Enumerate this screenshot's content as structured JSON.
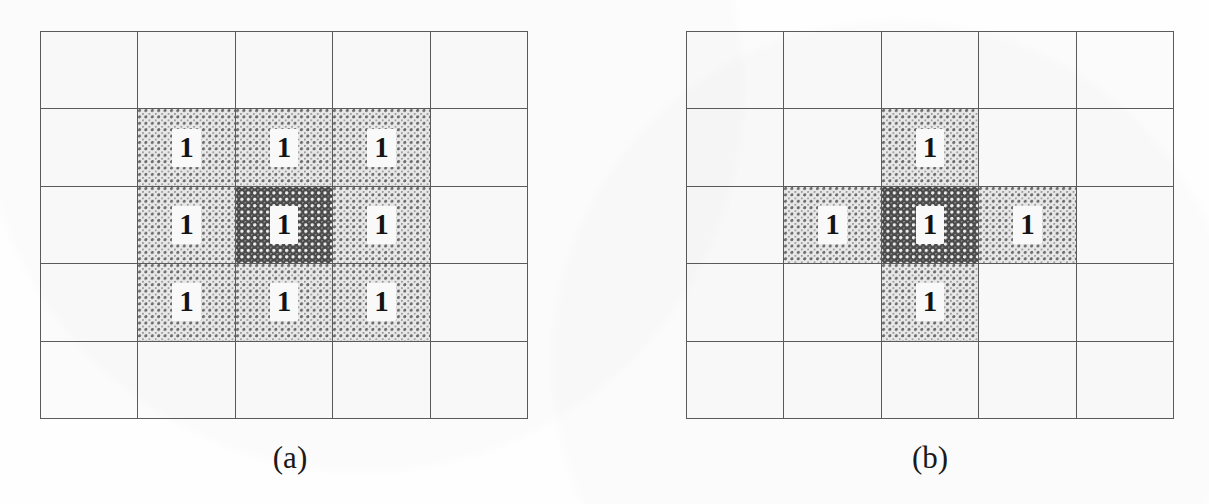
{
  "figure": {
    "kind": "pixel-neighborhood-diagram",
    "background_color": "#fefefe",
    "grid_line_color": "#5b5b5b",
    "cell_color": "#fbfbfb",
    "light_shade_color": "#ebebeb",
    "dark_shade_color": "#4b4b4b",
    "rows": 5,
    "columns": 5,
    "cell_value": "1"
  },
  "panels": [
    {
      "id": "panel-a",
      "caption": "(a)",
      "name": "8-neighborhood-grid",
      "left": 40,
      "top": 31,
      "width": 488,
      "height": 388,
      "caption_center_x": 290,
      "caption_top": 440,
      "cells": [
        [
          {
            "shade": "none",
            "value": ""
          },
          {
            "shade": "none",
            "value": ""
          },
          {
            "shade": "none",
            "value": ""
          },
          {
            "shade": "none",
            "value": ""
          },
          {
            "shade": "none",
            "value": ""
          }
        ],
        [
          {
            "shade": "none",
            "value": ""
          },
          {
            "shade": "light",
            "value": "1"
          },
          {
            "shade": "light",
            "value": "1"
          },
          {
            "shade": "light",
            "value": "1"
          },
          {
            "shade": "none",
            "value": ""
          }
        ],
        [
          {
            "shade": "none",
            "value": ""
          },
          {
            "shade": "light",
            "value": "1"
          },
          {
            "shade": "dark",
            "value": "1"
          },
          {
            "shade": "light",
            "value": "1"
          },
          {
            "shade": "none",
            "value": ""
          }
        ],
        [
          {
            "shade": "none",
            "value": ""
          },
          {
            "shade": "light",
            "value": "1"
          },
          {
            "shade": "light",
            "value": "1"
          },
          {
            "shade": "light",
            "value": "1"
          },
          {
            "shade": "none",
            "value": ""
          }
        ],
        [
          {
            "shade": "none",
            "value": ""
          },
          {
            "shade": "none",
            "value": ""
          },
          {
            "shade": "none",
            "value": ""
          },
          {
            "shade": "none",
            "value": ""
          },
          {
            "shade": "none",
            "value": ""
          }
        ]
      ]
    },
    {
      "id": "panel-b",
      "caption": "(b)",
      "name": "4-neighborhood-grid",
      "left": 686,
      "top": 31,
      "width": 488,
      "height": 388,
      "caption_center_x": 930,
      "caption_top": 440,
      "cells": [
        [
          {
            "shade": "none",
            "value": ""
          },
          {
            "shade": "none",
            "value": ""
          },
          {
            "shade": "none",
            "value": ""
          },
          {
            "shade": "none",
            "value": ""
          },
          {
            "shade": "none",
            "value": ""
          }
        ],
        [
          {
            "shade": "none",
            "value": ""
          },
          {
            "shade": "none",
            "value": ""
          },
          {
            "shade": "light",
            "value": "1"
          },
          {
            "shade": "none",
            "value": ""
          },
          {
            "shade": "none",
            "value": ""
          }
        ],
        [
          {
            "shade": "none",
            "value": ""
          },
          {
            "shade": "light",
            "value": "1"
          },
          {
            "shade": "dark",
            "value": "1"
          },
          {
            "shade": "light",
            "value": "1"
          },
          {
            "shade": "none",
            "value": ""
          }
        ],
        [
          {
            "shade": "none",
            "value": ""
          },
          {
            "shade": "none",
            "value": ""
          },
          {
            "shade": "light",
            "value": "1"
          },
          {
            "shade": "none",
            "value": ""
          },
          {
            "shade": "none",
            "value": ""
          }
        ],
        [
          {
            "shade": "none",
            "value": ""
          },
          {
            "shade": "none",
            "value": ""
          },
          {
            "shade": "none",
            "value": ""
          },
          {
            "shade": "none",
            "value": ""
          },
          {
            "shade": "none",
            "value": ""
          }
        ]
      ]
    }
  ]
}
